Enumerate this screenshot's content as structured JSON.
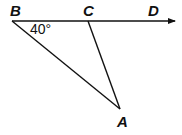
{
  "diagram": {
    "type": "geometry-figure",
    "points": {
      "B": {
        "label": "B",
        "x": 12,
        "y": 21
      },
      "C": {
        "label": "C",
        "x": 88,
        "y": 21
      },
      "D": {
        "label": "D",
        "x": 155,
        "y": 21
      },
      "A": {
        "label": "A",
        "x": 120,
        "y": 109
      }
    },
    "segments": [
      "BA",
      "CA"
    ],
    "rays": [
      "BD"
    ],
    "angle_label": "40°",
    "angle_at": "B",
    "colors": {
      "stroke": "#111111",
      "background": "#ffffff"
    }
  }
}
